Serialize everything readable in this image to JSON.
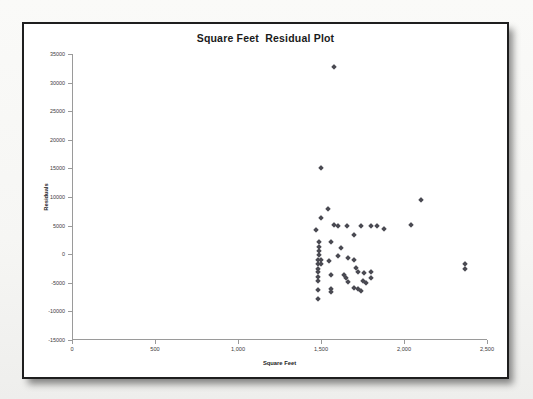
{
  "chart_data": {
    "type": "scatter",
    "title": "Square Feet  Residual Plot",
    "xlabel": "Square Feet",
    "ylabel": "Residuals",
    "xlim": [
      0,
      2500
    ],
    "ylim": [
      -15000,
      35000
    ],
    "xticks": [
      0,
      500,
      1000,
      1500,
      2000,
      2500
    ],
    "xtick_labels": [
      "0",
      "500",
      "1,000",
      "1,500",
      "2,000",
      "2,500"
    ],
    "yticks": [
      -15000,
      -10000,
      -5000,
      0,
      5000,
      10000,
      15000,
      20000,
      25000,
      30000,
      35000
    ],
    "ytick_labels": [
      "-15000",
      "-10000",
      "-5000",
      "0",
      "5000",
      "10000",
      "15000",
      "20000",
      "25000",
      "30000",
      "35000"
    ],
    "grid": false,
    "legend": false,
    "marker": "diamond",
    "marker_color": "#4a4a52",
    "series": [
      {
        "name": "Residuals",
        "points": [
          [
            1578,
            32800
          ],
          [
            1498,
            15000
          ],
          [
            1470,
            4200
          ],
          [
            1500,
            6300
          ],
          [
            1545,
            7900
          ],
          [
            1578,
            5100
          ],
          [
            1600,
            5000
          ],
          [
            1655,
            4900
          ],
          [
            1700,
            3400
          ],
          [
            1738,
            5000
          ],
          [
            1800,
            5000
          ],
          [
            1838,
            5000
          ],
          [
            1880,
            4400
          ],
          [
            2100,
            9400
          ],
          [
            2040,
            5100
          ],
          [
            1490,
            2200
          ],
          [
            1490,
            1300
          ],
          [
            1490,
            500
          ],
          [
            1490,
            -200
          ],
          [
            1560,
            2100
          ],
          [
            1620,
            1100
          ],
          [
            1600,
            -400
          ],
          [
            1660,
            -700
          ],
          [
            1480,
            -1100
          ],
          [
            1480,
            -1800
          ],
          [
            1480,
            -2500
          ],
          [
            1480,
            -3100
          ],
          [
            1480,
            -3900
          ],
          [
            1480,
            -4700
          ],
          [
            1500,
            -1000
          ],
          [
            1500,
            -1800
          ],
          [
            1550,
            -1200
          ],
          [
            1560,
            -3600
          ],
          [
            1700,
            -1100
          ],
          [
            1710,
            -2400
          ],
          [
            1720,
            -3100
          ],
          [
            1640,
            -3600
          ],
          [
            1650,
            -4200
          ],
          [
            1660,
            -4800
          ],
          [
            1760,
            -3200
          ],
          [
            1800,
            -3100
          ],
          [
            1800,
            -4200
          ],
          [
            1750,
            -4600
          ],
          [
            1770,
            -5000
          ],
          [
            1480,
            -6200
          ],
          [
            1480,
            -7800
          ],
          [
            1560,
            -6100
          ],
          [
            1560,
            -6600
          ],
          [
            1700,
            -5900
          ],
          [
            1720,
            -6100
          ],
          [
            1740,
            -6400
          ],
          [
            2370,
            -1700
          ],
          [
            2370,
            -2600
          ]
        ]
      }
    ]
  }
}
